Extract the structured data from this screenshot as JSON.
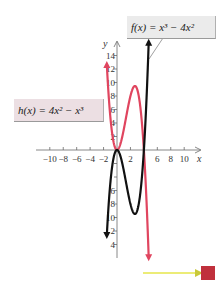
{
  "chart_data": {
    "type": "line",
    "title": "",
    "xlabel": "x",
    "ylabel": "y",
    "xlim": [
      -10,
      10
    ],
    "ylim": [
      -16,
      16
    ],
    "x_ticks": [
      -10,
      -8,
      -6,
      -4,
      -2,
      2,
      4,
      6,
      8,
      10
    ],
    "x_tick_labels": [
      "−10",
      "−8",
      "−6",
      "−4",
      "−2",
      "2",
      "",
      "6",
      "8",
      "10"
    ],
    "y_ticks": [
      14,
      12,
      10,
      8,
      6,
      4,
      2,
      -2,
      -4,
      -6,
      -8,
      -10,
      -12,
      -14
    ],
    "y_tick_labels": [
      "14",
      "12",
      "10",
      "8",
      "6",
      "4",
      "2",
      "",
      "",
      "6",
      "8",
      "10",
      "2",
      "4"
    ],
    "grid": false,
    "series": [
      {
        "name": "f(x) = x³ − 4x²",
        "expression": "x^3 - 4x^2",
        "color": "#111111",
        "x": [
          -1.6,
          -1,
          0,
          1,
          2,
          2.67,
          3,
          4,
          4.7
        ],
        "y": [
          -14.3,
          -5,
          0,
          -3,
          -8,
          -9.48,
          -9,
          0,
          15.5
        ]
      },
      {
        "name": "h(x) = 4x² − x³",
        "expression": "4x^2 - x^3",
        "color": "#e0455f",
        "x": [
          -1.55,
          -1,
          0,
          1,
          2,
          2.67,
          3,
          4,
          4.7
        ],
        "y": [
          13.3,
          5,
          0,
          3,
          8,
          9.48,
          9,
          0,
          -15.5
        ]
      }
    ],
    "annotations": [
      {
        "text": "f(x) = x³ − 4x²",
        "points_to": "f"
      },
      {
        "text": "h(x) = 4x² − x³",
        "points_to": "h"
      }
    ]
  },
  "labels": {
    "f": "f(x) = x³ − 4x²",
    "h": "h(x) = 4x² − x³",
    "x_axis": "x",
    "y_axis": "y"
  },
  "colors": {
    "f_curve": "#111111",
    "h_curve": "#e0455f",
    "axis": "#6a6a6a",
    "control_arrow": "#e6e64a",
    "control_square": "#c0303c"
  },
  "controls": {
    "next_icon": "next-arrow-icon"
  }
}
